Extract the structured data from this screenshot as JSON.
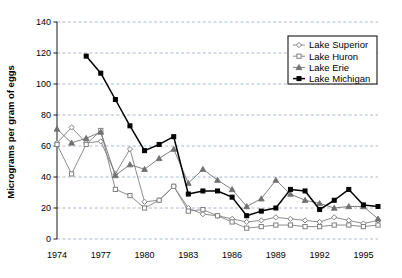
{
  "chart_data": {
    "type": "line",
    "title": "",
    "xlabel": "",
    "ylabel": "Micrograms per gram of eggs",
    "xlim": [
      1974,
      1996
    ],
    "ylim": [
      0,
      140
    ],
    "y_ticks": [
      0,
      20,
      40,
      60,
      80,
      100,
      120,
      140
    ],
    "x_ticks": [
      1974,
      1977,
      1980,
      1983,
      1986,
      1989,
      1992,
      1995
    ],
    "x_tick_labels": [
      "1974",
      "1977",
      "1980",
      "1983",
      "1986",
      "1989",
      "1992",
      "1995"
    ],
    "y_tick_labels": [
      "0",
      "20",
      "40",
      "60",
      "80",
      "100",
      "120",
      "140"
    ],
    "grid": true,
    "grid_axis": "y",
    "legend_position": "top-right",
    "x": [
      1974,
      1975,
      1976,
      1977,
      1978,
      1979,
      1980,
      1981,
      1982,
      1983,
      1984,
      1985,
      1986,
      1987,
      1988,
      1989,
      1990,
      1991,
      1992,
      1993,
      1994,
      1995,
      1996
    ],
    "series": [
      {
        "name": "Lake Superior",
        "marker": "diamond",
        "color": "#808080",
        "x": [
          1974,
          1975,
          1976,
          1977,
          1978,
          1979,
          1980,
          1981,
          1982,
          1983,
          1984,
          1985,
          1986,
          1987,
          1988,
          1989,
          1990,
          1991,
          1992,
          1993,
          1994,
          1995,
          1996
        ],
        "values": [
          62,
          72,
          62,
          63,
          42,
          58,
          24,
          25,
          34,
          20,
          16,
          15,
          13,
          11,
          12,
          14,
          13,
          12,
          11,
          14,
          12,
          10,
          12
        ]
      },
      {
        "name": "Lake Huron",
        "marker": "square",
        "color": "#808080",
        "x": [
          1974,
          1975,
          1976,
          1977,
          1978,
          1979,
          1980,
          1981,
          1982,
          1983,
          1984,
          1985,
          1986,
          1987,
          1988,
          1989,
          1990,
          1991,
          1992,
          1993,
          1994,
          1995,
          1996
        ],
        "values": [
          61,
          42,
          61,
          70,
          32,
          28,
          20,
          25,
          34,
          18,
          19,
          15,
          11,
          7,
          8,
          9,
          9,
          8,
          8,
          9,
          9,
          8,
          9
        ]
      },
      {
        "name": "Lake Erie",
        "marker": "triangle",
        "color": "#707070",
        "x": [
          1974,
          1975,
          1976,
          1977,
          1978,
          1979,
          1980,
          1981,
          1982,
          1983,
          1984,
          1985,
          1986,
          1987,
          1988,
          1989,
          1990,
          1991,
          1992,
          1993,
          1994,
          1995,
          1996
        ],
        "values": [
          71,
          62,
          65,
          69,
          41,
          48,
          45,
          52,
          58,
          36,
          45,
          38,
          32,
          21,
          26,
          38,
          29,
          25,
          23,
          20,
          21,
          21,
          13
        ]
      },
      {
        "name": "Lake Michigan",
        "marker": "square-filled",
        "color": "#000000",
        "x": [
          1976,
          1977,
          1978,
          1979,
          1980,
          1981,
          1982,
          1983,
          1984,
          1985,
          1986,
          1987,
          1988,
          1989,
          1990,
          1991,
          1992,
          1993,
          1994,
          1995,
          1996
        ],
        "values": [
          118,
          107,
          90,
          73,
          57,
          61,
          66,
          29,
          31,
          31,
          27,
          15,
          18,
          20,
          32,
          31,
          19,
          25,
          32,
          22,
          21
        ]
      }
    ]
  },
  "legend": {
    "items": [
      {
        "label": "Lake Superior"
      },
      {
        "label": "Lake Huron"
      },
      {
        "label": "Lake Erie"
      },
      {
        "label": "Lake Michigan"
      }
    ]
  },
  "colors": {
    "axis": "#000000",
    "grid": "#9aa8c0",
    "plot_background": "#ffffff",
    "superior": "#808080",
    "huron": "#808080",
    "erie": "#707070",
    "michigan": "#000000"
  }
}
